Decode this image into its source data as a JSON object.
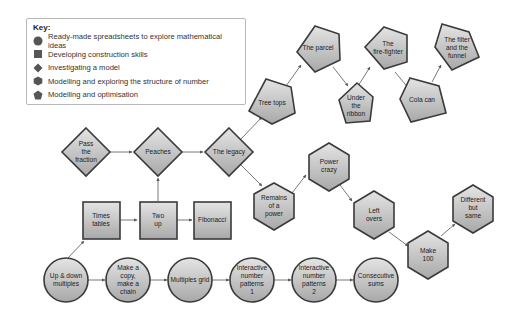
{
  "key": {
    "title": "Key:",
    "items": [
      {
        "shape": "circle",
        "label": "Ready-made spreadsheets to explore mathematical ideas"
      },
      {
        "shape": "square",
        "label": "Developing construction skills"
      },
      {
        "shape": "diamond",
        "label": "Investigating a model"
      },
      {
        "shape": "hexagon",
        "label": "Modelling and exploring the structure of number"
      },
      {
        "shape": "pentagon",
        "label": "Modelling and optimisation"
      }
    ]
  },
  "colors": {
    "fill_light": "#e2e2e2",
    "fill_dark": "#a9a9a9",
    "stroke": "#3a3a3a",
    "arrow": "#555555"
  },
  "nodes": {
    "pass_the_fraction": {
      "label": "Pass\nthe\nfraction",
      "shape": "diamond"
    },
    "peaches": {
      "label": "Peaches",
      "shape": "diamond"
    },
    "the_legacy": {
      "label": "The legacy",
      "shape": "diamond"
    },
    "times_tables": {
      "label": "Times\ntables",
      "shape": "square"
    },
    "two_up": {
      "label": "Two\nup",
      "shape": "square"
    },
    "fibonacci": {
      "label": "Fibonacci",
      "shape": "square"
    },
    "up_down_multiples": {
      "label": "Up & down\nmultiples",
      "shape": "circle"
    },
    "make_a_copy": {
      "label": "Make a\ncopy,\nmake a\nchain",
      "shape": "circle"
    },
    "multiples_grid": {
      "label": "Multiples grid",
      "shape": "circle"
    },
    "interactive_1": {
      "label": "Interactive\nnumber\npatterns\n1",
      "shape": "circle"
    },
    "interactive_2": {
      "label": "Interactive\nnumber\npatterns\n2",
      "shape": "circle"
    },
    "consecutive_sums": {
      "label": "Consecutive\nsums",
      "shape": "circle"
    },
    "tree_tops": {
      "label": "Tree tops",
      "shape": "pentagon"
    },
    "the_parcel": {
      "label": "The parcel",
      "shape": "pentagon"
    },
    "under_the_ribbon": {
      "label": "Under\nthe\nribbon",
      "shape": "pentagon"
    },
    "the_fire_fighter": {
      "label": "The\nfire-fighter",
      "shape": "pentagon"
    },
    "cola_can": {
      "label": "Cola can",
      "shape": "pentagon"
    },
    "the_filter_and_funnel": {
      "label": "The filter\nand the\nfunnel",
      "shape": "pentagon"
    },
    "remains_of_a_power": {
      "label": "Remains\nof a\npower",
      "shape": "hexagon"
    },
    "power_crazy": {
      "label": "Power\ncrazy",
      "shape": "hexagon"
    },
    "left_overs": {
      "label": "Left\novers",
      "shape": "hexagon"
    },
    "make_100": {
      "label": "Make\n100",
      "shape": "hexagon"
    },
    "different_but_same": {
      "label": "Different\nbut\nsame",
      "shape": "hexagon"
    }
  },
  "edges": [
    [
      "pass_the_fraction",
      "peaches"
    ],
    [
      "peaches",
      "the_legacy"
    ],
    [
      "two_up",
      "peaches"
    ],
    [
      "times_tables",
      "two_up"
    ],
    [
      "two_up",
      "fibonacci"
    ],
    [
      "up_down_multiples",
      "times_tables"
    ],
    [
      "up_down_multiples",
      "make_a_copy"
    ],
    [
      "make_a_copy",
      "multiples_grid"
    ],
    [
      "multiples_grid",
      "interactive_1"
    ],
    [
      "interactive_1",
      "interactive_2"
    ],
    [
      "interactive_2",
      "consecutive_sums"
    ],
    [
      "the_legacy",
      "tree_tops"
    ],
    [
      "tree_tops",
      "the_parcel"
    ],
    [
      "the_parcel",
      "under_the_ribbon"
    ],
    [
      "under_the_ribbon",
      "the_fire_fighter"
    ],
    [
      "the_fire_fighter",
      "cola_can"
    ],
    [
      "cola_can",
      "the_filter_and_funnel"
    ],
    [
      "the_legacy",
      "remains_of_a_power"
    ],
    [
      "remains_of_a_power",
      "power_crazy"
    ],
    [
      "power_crazy",
      "left_overs"
    ],
    [
      "left_overs",
      "make_100"
    ],
    [
      "make_100",
      "different_but_same"
    ]
  ]
}
